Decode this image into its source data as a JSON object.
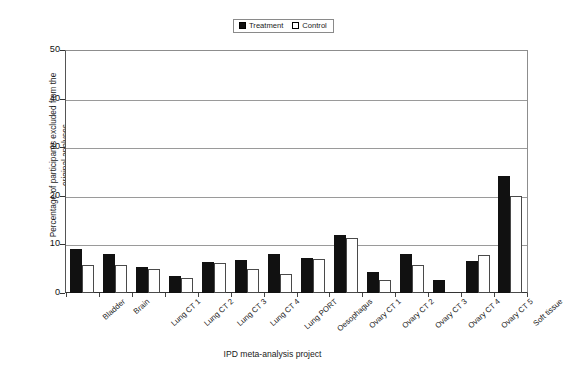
{
  "chart_data": {
    "type": "bar",
    "title": "",
    "xlabel": "IPD meta-analysis project",
    "ylabel": "Percentage of participants excluded from the\noriginal analyses",
    "ylim": [
      0,
      50
    ],
    "yticks": [
      0,
      10,
      20,
      30,
      40,
      50
    ],
    "grid": true,
    "legend_position": "top-center",
    "categories": [
      "Bladder",
      "Brain",
      "Lung CT 1",
      "Lung CT 2",
      "Lung CT 3",
      "Lung CT 4",
      "Lung PORT",
      "Oesophagus",
      "Ovary CT 1",
      "Ovary CT 2",
      "Ovary CT 3",
      "Ovary CT 4",
      "Ovary CT 5",
      "Soft tissue"
    ],
    "series": [
      {
        "name": "Treatment",
        "color": "#111111",
        "values": [
          9,
          8,
          5.3,
          3.5,
          6.4,
          6.7,
          8,
          7.3,
          12,
          4.4,
          8,
          2.7,
          6.6,
          24
        ]
      },
      {
        "name": "Control",
        "color": "#ffffff",
        "values": [
          5.8,
          5.8,
          5,
          3,
          6.1,
          5,
          3.9,
          6.9,
          11.3,
          2.7,
          5.7,
          0,
          7.8,
          20
        ]
      }
    ]
  },
  "legend": {
    "entries": [
      {
        "label": "Treatment",
        "swatch": "filled-square-icon"
      },
      {
        "label": "Control",
        "swatch": "hollow-square-icon"
      }
    ]
  },
  "axes": {
    "y_title": "Percentage of participants excluded from the\noriginal analyses",
    "x_title": "IPD meta-analysis project",
    "y_tick_labels": [
      "50",
      "40",
      "30",
      "20",
      "10",
      "0"
    ]
  }
}
